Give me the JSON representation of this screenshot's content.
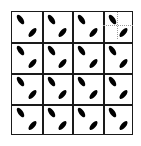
{
  "figure": {
    "rows": 4,
    "cols": 4,
    "line_color": "#1a1a1a",
    "ellipse_color": "#000000",
    "grid_lines_x": [
      11,
      42,
      72,
      103,
      133
    ],
    "grid_lines_y": [
      11,
      42,
      73,
      104,
      135
    ],
    "cell_motif": {
      "top_left_ellipse": "tilted backslash",
      "bottom_right_ellipse": "tilted forward slash"
    },
    "highlighted_cell": {
      "row": 0,
      "col": 3,
      "annotation": "dotted crosshair guide lines",
      "guide_color": "#9a9a9a"
    }
  }
}
